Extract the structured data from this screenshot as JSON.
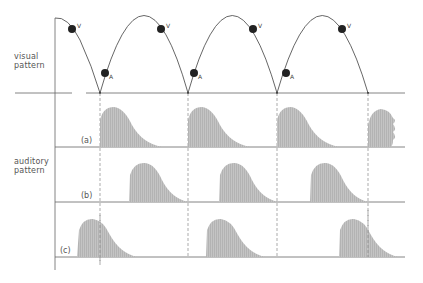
{
  "labels": {
    "visual": [
      "visual",
      "pattern"
    ],
    "auditory": [
      "auditory",
      "pattern"
    ],
    "row_a": "(a)",
    "row_b": "(b)",
    "row_c": "(c)",
    "marker_v": "V",
    "marker_a": "A"
  },
  "colors": {
    "line": "#555555",
    "fill": "#bdbdbd",
    "dot": "#222222",
    "dash": "#888888"
  },
  "geometry": {
    "axis_x": 55,
    "visual_baseline_y": 93,
    "bounce_x": [
      100,
      188,
      277,
      368
    ],
    "row_baselines_y": [
      147,
      202,
      257
    ]
  }
}
